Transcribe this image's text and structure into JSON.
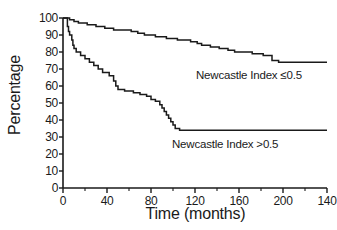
{
  "chart_data": {
    "type": "line",
    "title": "",
    "xlabel": "Time (months)",
    "ylabel": "Percentage",
    "xlim": [
      0,
      140
    ],
    "ylim": [
      0,
      100
    ],
    "grid": false,
    "legend_position": "inline-annotation",
    "xticks": [
      {
        "value": 0,
        "label": "0"
      },
      {
        "value": 40,
        "label": "40"
      },
      {
        "value": 80,
        "label": "80"
      },
      {
        "value": 120,
        "label": "120"
      },
      {
        "value": 160,
        "label": "160"
      },
      {
        "value": 200,
        "label": "200"
      },
      {
        "value": 240,
        "label": "140"
      }
    ],
    "xminor_ticks": [
      20,
      60,
      100,
      140,
      180,
      220
    ],
    "yticks": [
      {
        "value": 0,
        "label": "0"
      },
      {
        "value": 10,
        "label": "10"
      },
      {
        "value": 20,
        "label": "20"
      },
      {
        "value": 30,
        "label": "30"
      },
      {
        "value": 40,
        "label": "40"
      },
      {
        "value": 50,
        "label": "50"
      },
      {
        "value": 60,
        "label": "60"
      },
      {
        "value": 70,
        "label": "70"
      },
      {
        "value": 80,
        "label": "80"
      },
      {
        "value": 90,
        "label": "90"
      },
      {
        "value": 100,
        "label": "100"
      }
    ],
    "series": [
      {
        "name": "Newcastle Index ≤0.5",
        "annotation": "Newcastle Index ≤0.5",
        "color": "#1a1a1a",
        "points": [
          [
            0,
            100
          ],
          [
            6,
            100
          ],
          [
            6,
            99
          ],
          [
            10,
            99
          ],
          [
            10,
            98
          ],
          [
            14,
            98
          ],
          [
            14,
            97
          ],
          [
            22,
            97
          ],
          [
            22,
            96
          ],
          [
            30,
            96
          ],
          [
            30,
            95
          ],
          [
            38,
            95
          ],
          [
            38,
            94
          ],
          [
            46,
            94
          ],
          [
            46,
            93
          ],
          [
            62,
            93
          ],
          [
            62,
            92
          ],
          [
            68,
            92
          ],
          [
            68,
            91
          ],
          [
            74,
            91
          ],
          [
            74,
            90
          ],
          [
            84,
            90
          ],
          [
            84,
            89
          ],
          [
            94,
            89
          ],
          [
            94,
            88
          ],
          [
            104,
            88
          ],
          [
            104,
            87
          ],
          [
            116,
            87
          ],
          [
            116,
            86
          ],
          [
            122,
            86
          ],
          [
            122,
            85
          ],
          [
            126,
            85
          ],
          [
            126,
            84
          ],
          [
            134,
            84
          ],
          [
            134,
            83
          ],
          [
            142,
            83
          ],
          [
            142,
            82
          ],
          [
            150,
            82
          ],
          [
            150,
            81
          ],
          [
            156,
            81
          ],
          [
            156,
            80
          ],
          [
            172,
            80
          ],
          [
            172,
            79
          ],
          [
            182,
            79
          ],
          [
            182,
            78
          ],
          [
            190,
            78
          ],
          [
            190,
            75
          ],
          [
            196,
            75
          ],
          [
            196,
            74
          ],
          [
            240,
            74
          ]
        ]
      },
      {
        "name": "Newcastle Index >0.5",
        "annotation": "Newcastle Index >0.5",
        "color": "#1a1a1a",
        "points": [
          [
            0,
            100
          ],
          [
            4,
            100
          ],
          [
            4,
            95
          ],
          [
            5,
            95
          ],
          [
            5,
            92
          ],
          [
            6,
            92
          ],
          [
            6,
            90
          ],
          [
            8,
            90
          ],
          [
            8,
            87
          ],
          [
            9,
            87
          ],
          [
            9,
            84
          ],
          [
            10,
            84
          ],
          [
            10,
            82
          ],
          [
            12,
            82
          ],
          [
            12,
            80
          ],
          [
            16,
            80
          ],
          [
            16,
            78
          ],
          [
            20,
            78
          ],
          [
            20,
            76
          ],
          [
            24,
            76
          ],
          [
            24,
            74
          ],
          [
            28,
            74
          ],
          [
            28,
            72
          ],
          [
            32,
            72
          ],
          [
            32,
            70
          ],
          [
            36,
            70
          ],
          [
            36,
            68
          ],
          [
            42,
            68
          ],
          [
            42,
            66
          ],
          [
            46,
            66
          ],
          [
            46,
            63
          ],
          [
            48,
            63
          ],
          [
            48,
            60
          ],
          [
            50,
            60
          ],
          [
            50,
            58
          ],
          [
            56,
            58
          ],
          [
            56,
            57
          ],
          [
            64,
            57
          ],
          [
            64,
            56
          ],
          [
            70,
            56
          ],
          [
            70,
            55
          ],
          [
            76,
            55
          ],
          [
            76,
            54
          ],
          [
            80,
            54
          ],
          [
            80,
            52
          ],
          [
            84,
            52
          ],
          [
            84,
            51
          ],
          [
            88,
            51
          ],
          [
            88,
            49
          ],
          [
            90,
            49
          ],
          [
            90,
            47
          ],
          [
            92,
            47
          ],
          [
            92,
            45
          ],
          [
            94,
            45
          ],
          [
            94,
            43
          ],
          [
            96,
            43
          ],
          [
            96,
            41
          ],
          [
            98,
            41
          ],
          [
            98,
            39
          ],
          [
            100,
            39
          ],
          [
            100,
            37
          ],
          [
            102,
            37
          ],
          [
            102,
            35
          ],
          [
            106,
            35
          ],
          [
            106,
            34
          ],
          [
            240,
            34
          ]
        ]
      }
    ]
  }
}
